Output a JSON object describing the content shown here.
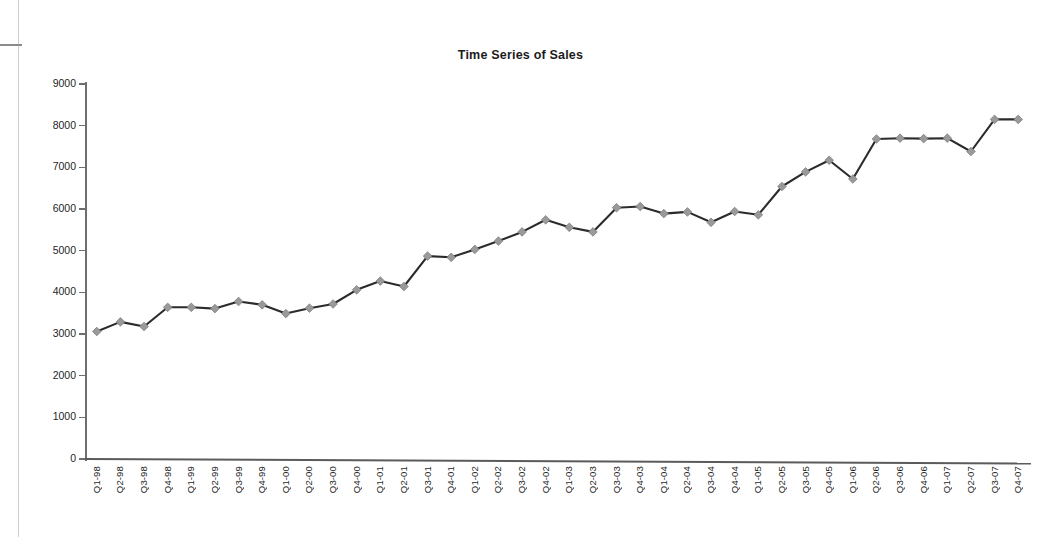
{
  "chart_data": {
    "type": "line",
    "title": "Time Series of Sales",
    "xlabel": "",
    "ylabel": "",
    "ylim": [
      0,
      9000
    ],
    "yticks": [
      0,
      1000,
      2000,
      3000,
      4000,
      5000,
      6000,
      7000,
      8000,
      9000
    ],
    "ytick_labels": [
      "0",
      "1000",
      "2000",
      "3000",
      "4000",
      "5000",
      "6000",
      "7000",
      "8000",
      "9000"
    ],
    "grid": false,
    "legend": "none",
    "marker": "diamond",
    "marker_color": "#9a9a9a",
    "line_color": "#2b2b2b",
    "categories": [
      "Q1-98",
      "Q2-98",
      "Q3-98",
      "Q4-98",
      "Q1-99",
      "Q2-99",
      "Q3-99",
      "Q4-99",
      "Q1-00",
      "Q2-00",
      "Q3-00",
      "Q4-00",
      "Q1-01",
      "Q2-01",
      "Q3-01",
      "Q4-01",
      "Q1-02",
      "Q2-02",
      "Q3-02",
      "Q4-02",
      "Q1-03",
      "Q2-03",
      "Q3-03",
      "Q4-03",
      "Q1-04",
      "Q2-04",
      "Q3-04",
      "Q4-04",
      "Q1-05",
      "Q2-05",
      "Q3-05",
      "Q4-05",
      "Q1-06",
      "Q2-06",
      "Q3-06",
      "Q4-06",
      "Q1-07",
      "Q2-07",
      "Q3-07",
      "Q4-07"
    ],
    "values": [
      3060,
      3290,
      3180,
      3640,
      3640,
      3610,
      3780,
      3700,
      3490,
      3620,
      3720,
      4060,
      4270,
      4140,
      4870,
      4840,
      5030,
      5230,
      5450,
      5740,
      5560,
      5450,
      6030,
      6060,
      5890,
      5930,
      5680,
      5940,
      5860,
      6540,
      6890,
      7170,
      6720,
      7680,
      7700,
      7690,
      7700,
      7380,
      8150,
      8150
    ],
    "series_name": "Sales"
  },
  "axes": {
    "y_axis_name": "sales-axis",
    "x_axis_name": "quarter-axis"
  }
}
